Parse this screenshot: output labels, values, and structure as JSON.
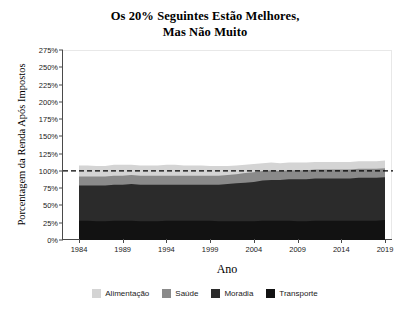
{
  "title": {
    "line1": "Os 20% Seguintes Estão Melhores,",
    "line2": "Mas Não Muito"
  },
  "axes": {
    "ylabel": "Porcentagem da Renda Após Impostos",
    "xlabel": "Ano",
    "yticks": [
      "0%",
      "25%",
      "50%",
      "75%",
      "100%",
      "125%",
      "150%",
      "175%",
      "200%",
      "225%",
      "250%",
      "275%"
    ],
    "xticks": [
      "1984",
      "1989",
      "1994",
      "1999",
      "2004",
      "2009",
      "2014",
      "2019"
    ]
  },
  "legend": {
    "items": [
      {
        "label": "Alimentação",
        "color": "#d4d4d4"
      },
      {
        "label": "Saúde",
        "color": "#8a8a8a"
      },
      {
        "label": "Moradia",
        "color": "#2b2b2b"
      },
      {
        "label": "Transporte",
        "color": "#121212"
      }
    ]
  },
  "chart_data": {
    "type": "area",
    "stacked": true,
    "title": "Os 20% Seguintes Estão Melhores, Mas Não Muito",
    "xlabel": "Ano",
    "ylabel": "Porcentagem da Renda Após Impostos",
    "xlim": [
      1984,
      2019
    ],
    "ylim": [
      0,
      275
    ],
    "ytick_step": 25,
    "grid": false,
    "legend_position": "bottom",
    "reference_line": {
      "value": 100,
      "style": "dashed",
      "color": "#000000"
    },
    "x": [
      1984,
      1985,
      1986,
      1987,
      1988,
      1989,
      1990,
      1991,
      1992,
      1993,
      1994,
      1995,
      1996,
      1997,
      1998,
      1999,
      2000,
      2001,
      2002,
      2003,
      2004,
      2005,
      2006,
      2007,
      2008,
      2009,
      2010,
      2011,
      2012,
      2013,
      2014,
      2015,
      2016,
      2017,
      2018,
      2019
    ],
    "series": [
      {
        "name": "Transporte",
        "color": "#121212",
        "values": [
          28,
          28,
          27,
          27,
          28,
          28,
          28,
          27,
          27,
          27,
          28,
          28,
          28,
          28,
          28,
          28,
          27,
          27,
          27,
          27,
          27,
          28,
          28,
          28,
          28,
          27,
          27,
          28,
          28,
          28,
          28,
          28,
          28,
          28,
          28,
          29
        ]
      },
      {
        "name": "Moradia",
        "color": "#2b2b2b",
        "values": [
          51,
          51,
          52,
          52,
          52,
          52,
          53,
          53,
          53,
          53,
          52,
          52,
          52,
          52,
          52,
          52,
          53,
          54,
          55,
          56,
          57,
          58,
          59,
          59,
          60,
          61,
          61,
          61,
          61,
          61,
          61,
          61,
          62,
          62,
          62,
          62
        ]
      },
      {
        "name": "Saúde",
        "color": "#8a8a8a",
        "values": [
          13,
          13,
          13,
          13,
          13,
          13,
          13,
          13,
          13,
          13,
          13,
          13,
          13,
          13,
          13,
          13,
          13,
          13,
          13,
          14,
          14,
          14,
          14,
          13,
          13,
          13,
          13,
          13,
          13,
          13,
          13,
          13,
          13,
          13,
          13,
          13
        ]
      },
      {
        "name": "Alimentação",
        "color": "#d4d4d4",
        "values": [
          16,
          16,
          15,
          15,
          16,
          16,
          15,
          15,
          15,
          15,
          16,
          16,
          15,
          15,
          15,
          14,
          14,
          13,
          13,
          12,
          12,
          11,
          11,
          11,
          11,
          11,
          11,
          11,
          11,
          11,
          11,
          11,
          11,
          11,
          11,
          11
        ]
      }
    ]
  }
}
